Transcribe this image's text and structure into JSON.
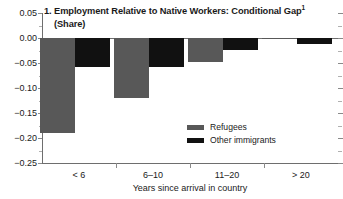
{
  "chart_data": {
    "type": "bar",
    "title": "1. Employment Relative to Native Workers: Conditional Gap",
    "title_superscript": "1",
    "subtitle": "(Share)",
    "xlabel": "Years since arrival in country",
    "ylabel": "",
    "categories": [
      "< 6",
      "6–10",
      "11–20",
      "> 20"
    ],
    "series": [
      {
        "name": "Refugees",
        "color": "#585858",
        "values": [
          -0.19,
          -0.12,
          -0.048,
          -0.002
        ]
      },
      {
        "name": "Other immigrants",
        "color": "#111111",
        "values": [
          -0.058,
          -0.058,
          -0.023,
          -0.012
        ]
      }
    ],
    "ylim": [
      -0.25,
      0.05
    ],
    "ytick_labels": [
      "0.05",
      "0.00",
      "−0.05",
      "−0.10",
      "−0.15",
      "−0.20",
      "−0.25"
    ],
    "ytick_values": [
      0.05,
      0.0,
      -0.05,
      -0.1,
      -0.15,
      -0.2,
      -0.25
    ],
    "yminor_values": [
      0.025,
      -0.025,
      -0.075,
      -0.125,
      -0.175,
      -0.225
    ],
    "grid": false,
    "legend_position": "center"
  },
  "legend": {
    "entries": [
      {
        "label": "Refugees"
      },
      {
        "label": "Other immigrants"
      }
    ]
  }
}
